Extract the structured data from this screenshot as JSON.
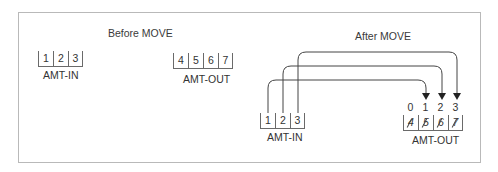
{
  "before": {
    "title": "Before MOVE",
    "amt_in": {
      "label": "AMT-IN",
      "cells": [
        "1",
        "2",
        "3"
      ]
    },
    "amt_out": {
      "label": "AMT-OUT",
      "cells": [
        "4",
        "5",
        "6",
        "7"
      ]
    }
  },
  "after": {
    "title": "After MOVE",
    "amt_in": {
      "label": "AMT-IN",
      "cells": [
        "1",
        "2",
        "3"
      ]
    },
    "amt_out": {
      "label": "AMT-OUT",
      "indices": [
        "0",
        "1",
        "2",
        "3"
      ],
      "cells": [
        "4",
        "5",
        "6",
        "7"
      ],
      "cells_struck": true
    },
    "arrows": [
      {
        "from": "AMT-IN[1]",
        "to": "AMT-OUT[1]"
      },
      {
        "from": "AMT-IN[2]",
        "to": "AMT-OUT[2]"
      },
      {
        "from": "AMT-IN[3]",
        "to": "AMT-OUT[3]"
      }
    ]
  },
  "colors": {
    "frame": "#b9b9b9",
    "line": "#444444",
    "text": "#333333"
  }
}
